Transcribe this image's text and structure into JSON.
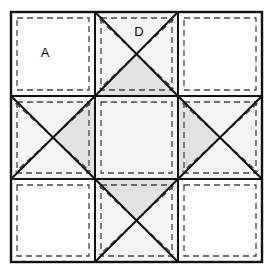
{
  "diagram": {
    "type": "quilt-block",
    "grid": {
      "rows": 3,
      "columns": 3
    },
    "geometry": {
      "canvas_width": 273,
      "canvas_height": 278,
      "block_left": 11,
      "block_top": 12,
      "block_right": 262,
      "block_bottom": 262,
      "column_x": [
        11,
        95,
        178,
        262
      ],
      "row_y": [
        12,
        96,
        179,
        262
      ],
      "seam_inset": 6
    },
    "colors": {
      "outline": "#111111",
      "seam_line": "#444444",
      "patch_white": "#ffffff",
      "patch_light": "#f4f4f4",
      "patch_shaded": "#e2e2e2",
      "background": "#ffffff",
      "label_text": "#111111"
    },
    "stroke": {
      "outline_width": 2.0,
      "diagonal_width": 2.0,
      "seam_width": 1.3,
      "seam_dash": "6,4"
    },
    "labels": [
      {
        "id": "label-a",
        "text": "A",
        "x": 45,
        "y": 54,
        "patch": "corner-square-top-left"
      },
      {
        "id": "label-d",
        "text": "D",
        "x": 139,
        "y": 33,
        "patch": "quarter-square-top-center"
      }
    ],
    "cells": [
      {
        "id": "corner-square-top-left",
        "name": "corner-square-top-left",
        "kind": "plain-square",
        "row": 0,
        "col": 0,
        "fill": "#ffffff",
        "label": "A"
      },
      {
        "id": "quarter-square-top-center",
        "name": "quarter-square-top-center",
        "kind": "quarter-square-triangle",
        "row": 0,
        "col": 1,
        "base_fill": "#f4f4f4",
        "shaded_triangle": "bottom",
        "shaded_fill": "#e2e2e2",
        "label": "D"
      },
      {
        "id": "corner-square-top-right",
        "name": "corner-square-top-right",
        "kind": "plain-square",
        "row": 0,
        "col": 2,
        "fill": "#ffffff",
        "label": ""
      },
      {
        "id": "quarter-square-middle-left",
        "name": "quarter-square-middle-left",
        "kind": "quarter-square-triangle",
        "row": 1,
        "col": 0,
        "base_fill": "#f4f4f4",
        "shaded_triangle": "right",
        "shaded_fill": "#e2e2e2",
        "label": ""
      },
      {
        "id": "center-square",
        "name": "center-square",
        "kind": "plain-square",
        "row": 1,
        "col": 1,
        "fill": "#f4f4f4",
        "label": ""
      },
      {
        "id": "quarter-square-middle-right",
        "name": "quarter-square-middle-right",
        "kind": "quarter-square-triangle",
        "row": 1,
        "col": 2,
        "base_fill": "#f4f4f4",
        "shaded_triangle": "left",
        "shaded_fill": "#e2e2e2",
        "label": ""
      },
      {
        "id": "corner-square-bottom-left",
        "name": "corner-square-bottom-left",
        "kind": "plain-square",
        "row": 2,
        "col": 0,
        "fill": "#ffffff",
        "label": ""
      },
      {
        "id": "quarter-square-bottom-center",
        "name": "quarter-square-bottom-center",
        "kind": "quarter-square-triangle",
        "row": 2,
        "col": 1,
        "base_fill": "#f4f4f4",
        "shaded_triangle": "top",
        "shaded_fill": "#e2e2e2",
        "label": ""
      },
      {
        "id": "corner-square-bottom-right",
        "name": "corner-square-bottom-right",
        "kind": "plain-square",
        "row": 2,
        "col": 2,
        "fill": "#ffffff",
        "label": ""
      }
    ]
  }
}
